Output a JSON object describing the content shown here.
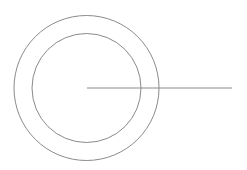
{
  "canvas": {
    "width": 247,
    "height": 170,
    "background": "#ffffff"
  },
  "stroke": {
    "color": "#8a8a8a",
    "width": 1
  },
  "center": {
    "x": 86.5,
    "y": 88
  },
  "shapes": {
    "outer_circle": {
      "cx": 86.5,
      "cy": 88,
      "r": 72.5
    },
    "inner_circle": {
      "cx": 86.5,
      "cy": 88,
      "r": 54.5
    },
    "radius_line": {
      "x1": 87,
      "y1": 88,
      "x2": 232,
      "y2": 88
    }
  }
}
